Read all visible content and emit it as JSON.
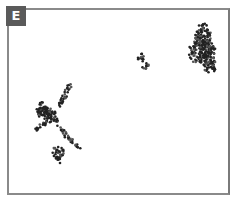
{
  "panel": {
    "label": "E",
    "label_bg": "#5a5a5a",
    "border_color": "#8a8a8a"
  },
  "clusters": [
    {
      "name": "large-cluster-top-right",
      "cx": 205,
      "cy": 50,
      "rx": 16,
      "ry": 28
    },
    {
      "name": "small-cluster-center",
      "cx": 143,
      "cy": 62,
      "rx": 5,
      "ry": 7
    },
    {
      "name": "branching-cluster-left",
      "cx": 55,
      "cy": 118,
      "rx": 25,
      "ry": 35
    },
    {
      "name": "small-cluster-bottom-left",
      "cx": 58,
      "cy": 153,
      "rx": 7,
      "ry": 7
    }
  ]
}
